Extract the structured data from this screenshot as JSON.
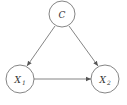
{
  "diagram": {
    "type": "causal-dag",
    "colors": {
      "stroke": "#666666",
      "text": "#333333",
      "background": "#ffffff"
    },
    "nodes": [
      {
        "id": "C",
        "label": "C",
        "subscript": "",
        "cx": 62,
        "cy": 14,
        "r": 13
      },
      {
        "id": "X1",
        "label": "X",
        "subscript": "1",
        "cx": 20,
        "cy": 79,
        "r": 14
      },
      {
        "id": "X2",
        "label": "X",
        "subscript": "2",
        "cx": 105,
        "cy": 79,
        "r": 14
      }
    ],
    "edges": [
      {
        "from": "C",
        "to": "X1"
      },
      {
        "from": "C",
        "to": "X2"
      },
      {
        "from": "X1",
        "to": "X2"
      }
    ]
  }
}
